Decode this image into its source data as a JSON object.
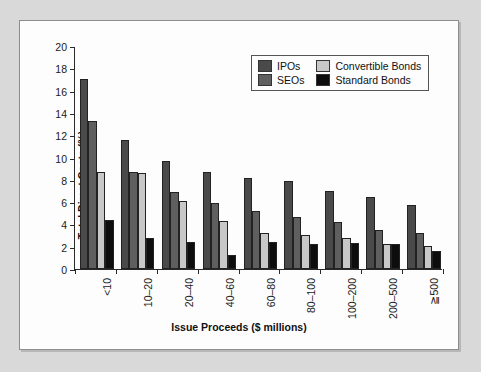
{
  "chart_data": {
    "type": "bar",
    "title": "",
    "subtitle": "",
    "xlabel": "Issue Proceeds ($ millions)",
    "ylabel": "Total Direct Costs (%)",
    "ylim": [
      0,
      20
    ],
    "ytick_step": 2,
    "yticks": [
      "20",
      "18",
      "16",
      "14",
      "12",
      "10",
      "8",
      "6",
      "4",
      "2",
      "0"
    ],
    "grid": false,
    "legend_position": "top-right",
    "categories": [
      "<10",
      "10–20",
      "20–40",
      "40–60",
      "60–80",
      "80–100",
      "100–200",
      "200–500",
      "≧500"
    ],
    "series": [
      {
        "name": "IPOs",
        "color": "#4a4a4a",
        "values": [
          17.0,
          11.6,
          9.7,
          8.7,
          8.2,
          7.9,
          7.0,
          6.5,
          5.7
        ]
      },
      {
        "name": "SEOs",
        "color": "#5f5f5f",
        "values": [
          13.3,
          8.7,
          6.9,
          5.9,
          5.2,
          4.7,
          4.25,
          3.5,
          3.2
        ]
      },
      {
        "name": "Convertible Bonds",
        "color": "#c8c8c8",
        "values": [
          8.7,
          8.6,
          6.1,
          4.3,
          3.25,
          3.05,
          2.8,
          2.2,
          2.1
        ]
      },
      {
        "name": "Standard Bonds",
        "color": "#0d0d0d",
        "values": [
          4.4,
          2.8,
          2.45,
          1.3,
          2.4,
          2.2,
          2.35,
          2.25,
          1.65
        ]
      }
    ]
  },
  "legend": {
    "items": [
      {
        "label": "IPOs",
        "color": "#4a4a4a"
      },
      {
        "label": "Convertible Bonds",
        "color": "#c8c8c8"
      },
      {
        "label": "SEOs",
        "color": "#5f5f5f"
      },
      {
        "label": "Standard Bonds",
        "color": "#0d0d0d"
      }
    ]
  },
  "colors": {
    "page_background": "#d9d9d9",
    "panel_background": "#fdfdfd",
    "panel_border": "#8d8d8d",
    "axis": "#2a2a2a",
    "text": "#111111"
  }
}
